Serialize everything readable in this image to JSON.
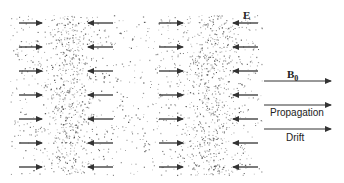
{
  "diagram": {
    "title": "",
    "colors": {
      "background": "#ffffff",
      "speckle": "#333333",
      "arrow": "#333333",
      "text": "#222222"
    },
    "region": {
      "x": 10,
      "y": 15,
      "width": 252,
      "height": 160
    },
    "dense_bands": [
      {
        "name": "compression-band-1",
        "center_x": 68,
        "half_width": 18
      },
      {
        "name": "compression-band-2",
        "center_x": 210,
        "half_width": 19
      }
    ],
    "field_rows_y": [
      23,
      47,
      71,
      95,
      119,
      143,
      167
    ],
    "field_arrow_columns": [
      {
        "x1": 19,
        "x2": 42,
        "direction": "right"
      },
      {
        "x1": 113,
        "x2": 88,
        "direction": "left"
      },
      {
        "x1": 159,
        "x2": 183,
        "direction": "right"
      },
      {
        "x1": 258,
        "x2": 233,
        "direction": "left"
      }
    ],
    "field_label": {
      "text": "E",
      "x": 243,
      "y": 10
    },
    "legend": [
      {
        "name": "b0",
        "label": "B",
        "subscript": "0",
        "arrow_y": 81,
        "label_x": 287,
        "label_y": 69
      },
      {
        "name": "propagation",
        "label": "Propagation",
        "arrow_y": 105,
        "label_x": 270,
        "label_y": 107
      },
      {
        "name": "drift",
        "label": "Drift",
        "arrow_y": 129,
        "label_x": 286,
        "label_y": 132
      }
    ],
    "legend_arrow_x": [
      264,
      331
    ]
  }
}
